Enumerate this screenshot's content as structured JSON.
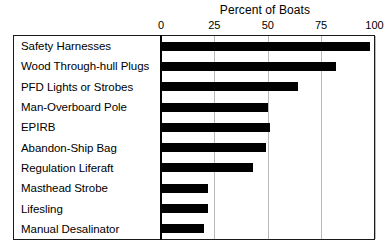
{
  "chart_data": {
    "type": "bar",
    "orientation": "horizontal",
    "title": "Percent of Boats",
    "xlabel": "",
    "ylabel": "",
    "xlim": [
      0,
      100
    ],
    "xticks": [
      0,
      25,
      50,
      75,
      100
    ],
    "xticklabels": [
      "0",
      "25",
      "50",
      "75",
      "100"
    ],
    "grid": true,
    "grid_axis": "x",
    "legend": false,
    "bar_color": "#000000",
    "categories": [
      "Safety Harnesses",
      "Wood Through-hull Plugs",
      "PFD Lights or Strobes",
      "Man-Overboard Pole",
      "EPIRB",
      "Abandon-Ship Bag",
      "Regulation Liferaft",
      "Masthead Strobe",
      "Lifesling",
      "Manual Desalinator"
    ],
    "values": [
      98,
      82,
      64,
      50,
      51,
      49,
      43,
      22,
      22,
      20
    ]
  },
  "figure": {
    "background": "#ffffff",
    "frame_color": "#1a1a1a",
    "gridline_color": "#b9b9b9"
  }
}
